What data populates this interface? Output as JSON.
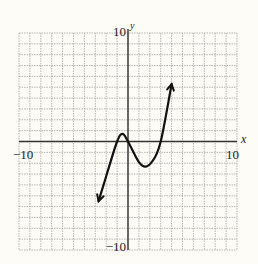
{
  "chart_data": {
    "type": "line",
    "title": "",
    "xlabel": "x",
    "ylabel": "y",
    "xlim": [
      -10,
      10
    ],
    "ylim": [
      -10,
      10
    ],
    "grid": true,
    "grid_step": 1,
    "tick_labels": {
      "x_min": "−10",
      "x_max": "10",
      "y_min": "−10",
      "y_max": "10"
    },
    "series": [
      {
        "name": "cubic curve",
        "arrows_both_ends": true,
        "points": [
          {
            "x": -2.7,
            "y": -5.5
          },
          {
            "x": -2.0,
            "y": -3.2
          },
          {
            "x": -1.0,
            "y": 0.0
          },
          {
            "x": -0.5,
            "y": 0.7
          },
          {
            "x": 0.0,
            "y": 0.0
          },
          {
            "x": 1.0,
            "y": -1.9
          },
          {
            "x": 1.7,
            "y": -2.3
          },
          {
            "x": 2.5,
            "y": -1.4
          },
          {
            "x": 3.0,
            "y": 0.0
          },
          {
            "x": 3.5,
            "y": 2.5
          },
          {
            "x": 4.0,
            "y": 5.3
          }
        ],
        "x_intercepts": [
          -1,
          0,
          3
        ],
        "local_max": {
          "x": -0.5,
          "y": 0.7
        },
        "local_min": {
          "x": 1.7,
          "y": -2.3
        }
      }
    ]
  }
}
